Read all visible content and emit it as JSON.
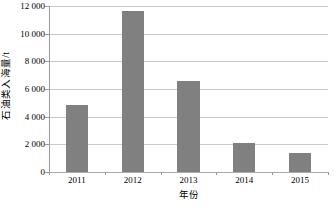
{
  "chart_data": {
    "type": "bar",
    "title": "",
    "subtitle": "",
    "xlabel": "年份",
    "ylabel": "石油类入海量/t",
    "categories": [
      "2011",
      "2012",
      "2013",
      "2014",
      "2015"
    ],
    "values": [
      4880,
      11650,
      6550,
      2100,
      1350
    ],
    "series": [
      {
        "name": "石油类入海量",
        "values": [
          4880,
          11650,
          6550,
          2100,
          1350
        ]
      }
    ],
    "ylim": [
      0,
      12000
    ],
    "ytick_values": [
      0,
      2000,
      4000,
      6000,
      8000,
      10000,
      12000
    ],
    "ytick_labels": [
      "0",
      "2 000",
      "4 000",
      "6 000",
      "8 000",
      "10 000",
      "12 000"
    ],
    "xtick_labels": [
      "2011",
      "2012",
      "2013",
      "2014",
      "2015"
    ],
    "grid": "horizontal",
    "legend": "none",
    "bar_color": "#808080",
    "gridline_color": "#c9c9c9",
    "axis_color": "#9a9a9a",
    "annotations": []
  }
}
